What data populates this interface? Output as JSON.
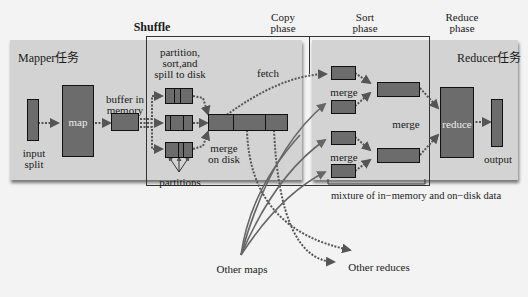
{
  "diagram": {
    "type": "MapReduce shuffle and sort flow",
    "phase_labels": {
      "shuffle": "Shuffle",
      "copy": "Copy\nphase",
      "copy_line1": "Copy",
      "copy_line2": "phase",
      "sort_line1": "Sort",
      "sort_line2": "phase",
      "reduce_line1": "Reduce",
      "reduce_line2": "phase"
    },
    "mapper": {
      "title": "Mapper任务",
      "input_split_line1": "input",
      "input_split_line2": "split",
      "map_label": "map",
      "buffer_line1": "buffer in",
      "buffer_line2": "memory",
      "spill_line1": "partition,",
      "spill_line2": "sort,and",
      "spill_line3": "spill to disk",
      "partitions_label": "partitions",
      "merge_disk_line1": "merge",
      "merge_disk_line2": "on disk"
    },
    "copy": {
      "fetch_label": "fetch"
    },
    "reducer": {
      "title": "Reducer任务",
      "merge_label_1": "merge",
      "merge_label_2": "merge",
      "merge_label_3": "merge",
      "mixture_label": "mixture of in−memory and on−disk data",
      "reduce_label": "reduce",
      "output_label": "output"
    },
    "external": {
      "other_maps": "Other maps",
      "other_reduces": "Other reduces"
    },
    "colors": {
      "background": "#f3f3f3",
      "panel": "#d3d3d3",
      "box_fill": "#6c6c6c",
      "box_border": "#111111",
      "arrow": "#555555"
    }
  }
}
